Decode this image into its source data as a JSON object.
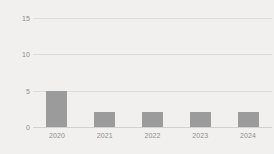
{
  "chart_data": {
    "type": "bar",
    "title": "",
    "subtitle": "",
    "xlabel": "",
    "ylabel": "",
    "categories": [
      "2020",
      "2021",
      "2022",
      "2023",
      "2024"
    ],
    "values": [
      5,
      2,
      2,
      2,
      2
    ],
    "series": [
      {
        "name": "",
        "values": [
          5,
          2,
          2,
          2,
          2
        ]
      }
    ],
    "ylim": [
      0,
      15
    ],
    "yticks": [
      0,
      5,
      10,
      15
    ],
    "ytick_labels": [
      "0",
      "5",
      "10",
      "15"
    ],
    "grid": true,
    "grid_axis": "y",
    "legend": false,
    "legend_position": "none",
    "annotations": [],
    "colors": {
      "background": "#f1f0ee",
      "bar": "#9b9b9b",
      "gridline": "#dedcda",
      "axis": "#d3d1cf",
      "tick_label": "#8d8d8d"
    }
  }
}
